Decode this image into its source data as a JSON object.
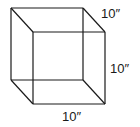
{
  "diagram": {
    "type": "cube-wireframe",
    "labels": {
      "depth": "10″",
      "height": "10″",
      "width": "10″"
    },
    "vertices": {
      "back_top_left": [
        11,
        8
      ],
      "back_top_right": [
        83,
        8
      ],
      "back_bottom_left": [
        11,
        80
      ],
      "back_bottom_right": [
        83,
        80
      ],
      "front_top_left": [
        33,
        32
      ],
      "front_top_right": [
        105,
        32
      ],
      "front_bottom_left": [
        33,
        104
      ],
      "front_bottom_right": [
        105,
        104
      ]
    },
    "colors": {
      "line": "#1a1a1a",
      "background": "#ffffff"
    }
  }
}
